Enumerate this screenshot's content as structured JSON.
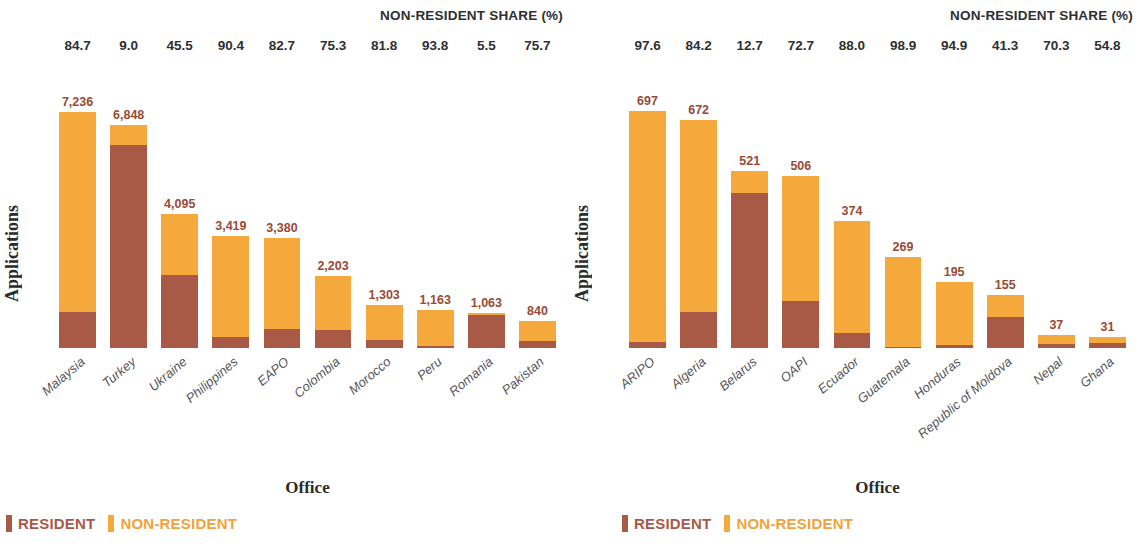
{
  "chart_data": [
    {
      "id": "left",
      "type": "bar",
      "subtype": "stacked",
      "title": "",
      "share_header": "NON-RESIDENT SHARE (%)",
      "xlabel": "Office",
      "ylabel": "Applications",
      "ylim": [
        0,
        7600
      ],
      "grid": false,
      "legend_position": "bottom-left",
      "categories": [
        "Malaysia",
        "Turkey",
        "Ukraine",
        "Philippines",
        "EAPO",
        "Colombia",
        "Morocco",
        "Peru",
        "Romania",
        "Pakistan"
      ],
      "totals": [
        7236,
        6848,
        4095,
        3419,
        3380,
        2203,
        1303,
        1163,
        1063,
        840
      ],
      "total_labels": [
        "7,236",
        "6,848",
        "4,095",
        "3,419",
        "3,380",
        "2,203",
        "1,303",
        "1,163",
        "1,063",
        "840"
      ],
      "nonresident_share": [
        84.7,
        9.0,
        45.5,
        90.4,
        82.7,
        75.3,
        81.8,
        93.8,
        5.5,
        75.7
      ],
      "share_labels": [
        "84.7",
        "9.0",
        "45.5",
        "90.4",
        "82.7",
        "75.3",
        "81.8",
        "93.8",
        "5.5",
        "75.7"
      ],
      "series": [
        {
          "name": "RESIDENT",
          "color": "#A85A47",
          "values": [
            1107,
            6232,
            2232,
            328,
            585,
            544,
            237,
            72,
            1005,
            204
          ]
        },
        {
          "name": "NON-RESIDENT",
          "color": "#F5A83C",
          "values": [
            6129,
            616,
            1863,
            3091,
            2795,
            1659,
            1066,
            1091,
            58,
            636
          ]
        }
      ]
    },
    {
      "id": "right",
      "type": "bar",
      "subtype": "stacked",
      "title": "",
      "share_header": "NON-RESIDENT SHARE (%)",
      "xlabel": "Office",
      "ylabel": "Applications",
      "ylim": [
        0,
        730
      ],
      "grid": false,
      "legend_position": "bottom-left",
      "categories": [
        "ARIPO",
        "Algeria",
        "Belarus",
        "OAPI",
        "Ecuador",
        "Guatemala",
        "Honduras",
        "Republic of Moldova",
        "Nepal",
        "Ghana"
      ],
      "totals": [
        697,
        672,
        521,
        506,
        374,
        269,
        195,
        155,
        37,
        31
      ],
      "total_labels": [
        "697",
        "672",
        "521",
        "506",
        "374",
        "269",
        "195",
        "155",
        "37",
        "31"
      ],
      "nonresident_share": [
        97.6,
        84.2,
        12.7,
        72.7,
        88.0,
        98.9,
        94.9,
        41.3,
        70.3,
        54.8
      ],
      "share_labels": [
        "97.6",
        "84.2",
        "12.7",
        "72.7",
        "88.0",
        "98.9",
        "94.9",
        "41.3",
        "70.3",
        "54.8"
      ],
      "series": [
        {
          "name": "RESIDENT",
          "color": "#A85A47",
          "values": [
            17,
            106,
            455,
            138,
            45,
            3,
            10,
            91,
            11,
            14
          ]
        },
        {
          "name": "NON-RESIDENT",
          "color": "#F5A83C",
          "values": [
            680,
            566,
            66,
            368,
            329,
            266,
            185,
            64,
            26,
            17
          ]
        }
      ]
    }
  ],
  "legend": {
    "resident_label": "RESIDENT",
    "nonresident_label": "NON-RESIDENT",
    "resident_color": "#A85A47",
    "nonresident_color": "#F5A83C"
  }
}
